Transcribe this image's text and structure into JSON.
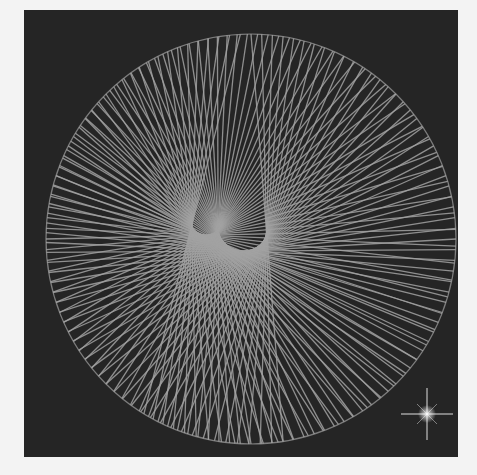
{
  "artwork": {
    "subject": "string-art spiral",
    "colors": {
      "page_background": "#f3f3f3",
      "panel_background": "#252525",
      "thread": "#a2a2a2",
      "sparkle": "#ffffff"
    },
    "circle": {
      "cx": 227,
      "cy": 229,
      "r": 205
    },
    "focus": {
      "x": 164,
      "y": 228
    },
    "thread_count": 120,
    "sparkle": {
      "x": 403,
      "y": 404,
      "size": 26,
      "icon": "sparkle-star-icon"
    }
  }
}
